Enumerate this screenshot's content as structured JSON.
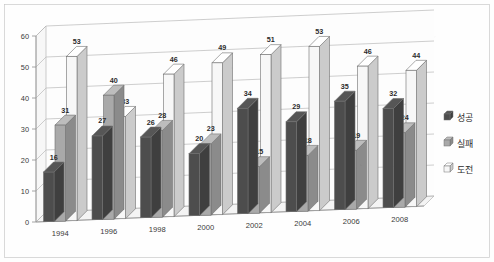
{
  "chart_data": {
    "type": "bar",
    "title": "",
    "subtitle": "",
    "xlabel": "",
    "ylabel": "",
    "categories": [
      "1994",
      "1996",
      "1998",
      "2000",
      "2002",
      "2004",
      "2006",
      "2008"
    ],
    "series": [
      {
        "name": "성공",
        "color": "#4d4d4d",
        "values": [
          16,
          27,
          26,
          20,
          34,
          29,
          35,
          32
        ]
      },
      {
        "name": "실패",
        "color": "#a9a9a9",
        "values": [
          31,
          40,
          28,
          23,
          15,
          18,
          19,
          24
        ]
      },
      {
        "name": "도전",
        "color": "#f7f7f7",
        "values": [
          53,
          33,
          46,
          49,
          51,
          53,
          46,
          44
        ]
      }
    ],
    "ylim": [
      0,
      60
    ],
    "yticks": [
      0,
      10,
      20,
      30,
      40,
      50,
      60
    ],
    "ytick_labels": [
      "0",
      "10",
      "20",
      "30",
      "40",
      "50",
      "60"
    ],
    "grid": true,
    "legend_position": "right",
    "style": "3d-clustered-column",
    "data_labels": true
  },
  "legend": {
    "items": [
      {
        "label": "성공",
        "swatch": "dark-gray"
      },
      {
        "label": "실패",
        "swatch": "medium-gray"
      },
      {
        "label": "도전",
        "swatch": "white"
      }
    ]
  }
}
